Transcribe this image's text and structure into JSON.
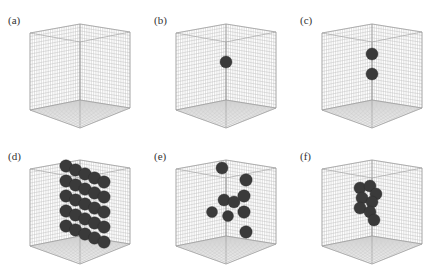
{
  "figure": {
    "panels": [
      {
        "id": "a",
        "label": "(a)",
        "sphere_count": 0,
        "description": "empty wireframe cube"
      },
      {
        "id": "b",
        "label": "(b)",
        "sphere_count": 1,
        "description": "single sphere at center"
      },
      {
        "id": "c",
        "label": "(c)",
        "sphere_count": 2,
        "description": "two spheres stacked vertically"
      },
      {
        "id": "d",
        "label": "(d)",
        "sphere_count": 25,
        "description": "dense lattice of spheres forming a slab"
      },
      {
        "id": "e",
        "label": "(e)",
        "sphere_count": 10,
        "description": "scattered spheres"
      },
      {
        "id": "f",
        "label": "(f)",
        "sphere_count": 10,
        "description": "compact cluster of spheres"
      }
    ],
    "colors": {
      "grid": "#bdbdbd",
      "edge": "#9a9a9a",
      "sphere": "#3a3a3a",
      "sphere_highlight": "#5a5a5a",
      "background": "#ffffff"
    }
  }
}
